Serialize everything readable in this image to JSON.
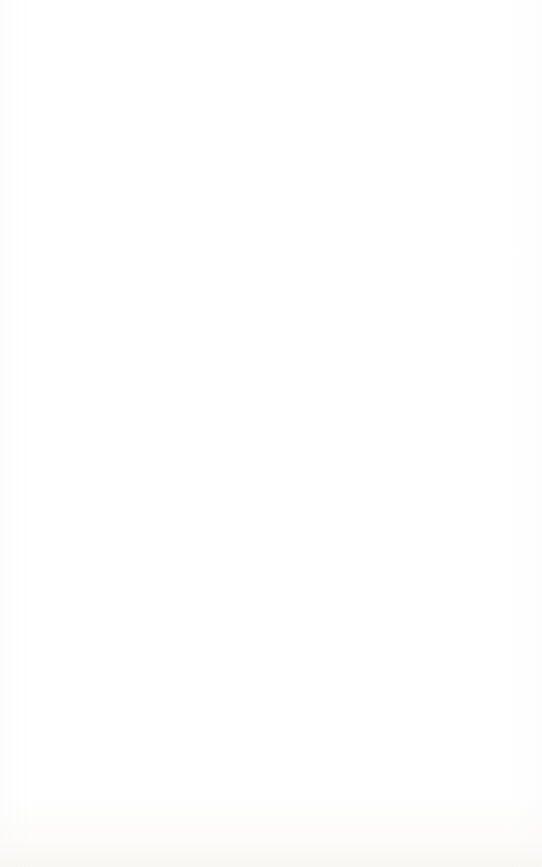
{
  "page": {
    "kind": "scanned-lined-paper",
    "width_px": 542,
    "height_px": 867,
    "background_color": "#ffffff",
    "rule_color": "#acb0b5",
    "rule_thickness_px": 1,
    "skew_degrees": -0.18,
    "content_text": "",
    "note": "Blank ruled page — no printed or handwritten text present"
  },
  "header_rule": {
    "name": "top-short-rule",
    "y": 73,
    "x_start": 15,
    "x_end": 240,
    "length_px": 225
  },
  "body_rules": {
    "count": 21,
    "x_start": 15,
    "x_end": 520,
    "length_px": 505,
    "first_y": 165,
    "spacing_px": 32,
    "last_y": 805,
    "y_positions": [
      165,
      197,
      229,
      261,
      293,
      325,
      357,
      389,
      421,
      453,
      485,
      517,
      549,
      581,
      613,
      645,
      677,
      709,
      741,
      773,
      805
    ]
  }
}
